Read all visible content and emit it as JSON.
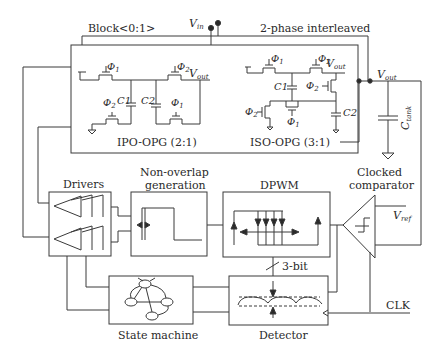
{
  "figure": {
    "type": "circuit-block-diagram",
    "colors": {
      "line": "#3a3a3a",
      "text": "#2a2a2a",
      "background": "#ffffff"
    }
  },
  "top": {
    "block_label": "Block<0:1>",
    "vin_label": "V",
    "vin_sub": "in",
    "interleave_label": "2-phase interleaved"
  },
  "opg": {
    "ipo": {
      "title": "IPO-OPG (2:1)",
      "switches": [
        "Φ1",
        "Φ2",
        "Φ2",
        "Φ1"
      ],
      "caps": [
        "C1",
        "C2"
      ],
      "vout": "V",
      "vout_sub": "out"
    },
    "iso": {
      "title": "ISO-OPG (3:1)",
      "switches": [
        "Φ1",
        "Φ2",
        "Φ2",
        "Φ2",
        "Φ1"
      ],
      "caps": [
        "C1",
        "C2"
      ],
      "vout": "V",
      "vout_sub": "out"
    }
  },
  "output": {
    "vout": "V",
    "vout_sub": "out",
    "ctank": "C",
    "ctank_sub": "tank"
  },
  "blocks": {
    "drivers": "Drivers",
    "nonoverlap_line1": "Non-overlap",
    "nonoverlap_line2": "generation",
    "dpwm": "DPWM",
    "comparator_line1": "Clocked",
    "comparator_line2": "comparator",
    "vref": "V",
    "vref_sub": "ref",
    "bus_width": "3-bit",
    "state_machine": "State machine",
    "detector": "Detector",
    "clk": "CLK"
  },
  "symbols": {
    "phi1": "Φ",
    "phi1_sub": "1",
    "phi2": "Φ",
    "phi2_sub": "2"
  }
}
